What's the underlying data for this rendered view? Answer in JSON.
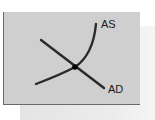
{
  "diagram": {
    "type": "aggregate-supply-aggregate-demand",
    "curves": [
      {
        "id": "as",
        "label": "AS",
        "shape": "upward-sloping convex, steepening"
      },
      {
        "id": "ad",
        "label": "AD",
        "shape": "downward-sloping straight line"
      }
    ],
    "equilibrium": {
      "marker": "filled-dot"
    },
    "colors": {
      "panel": "#cfcfcf",
      "shadow": "#e8e8e8",
      "curve": "#2a2a2a",
      "border": "#6a6a6a"
    }
  }
}
